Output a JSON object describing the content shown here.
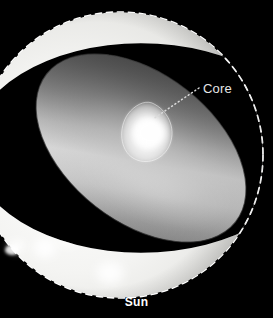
{
  "figure": {
    "title_caption": "Sun",
    "background_color": "#000000"
  },
  "labels": {
    "core": "Core",
    "sun": "Sun"
  },
  "colors": {
    "background": "#000000",
    "photosphere_light": "#f2f2f0",
    "photosphere_mid": "#d8d8d6",
    "interior_gray": "#8a8a8a",
    "interior_dark": "#5a5a5a",
    "core_glow": "#ffffff",
    "outline_dashed": "#ffffff",
    "leader_line": "#d9d9d9",
    "sunspot": "#6b6b6b",
    "label_text": "#e6e6e6",
    "caption_text": "#ffffff"
  },
  "annotations": {
    "core_leader": {
      "style": "dotted",
      "from_x": 199,
      "from_y": 88,
      "to_x": 152,
      "to_y": 118
    },
    "sphere_outline": {
      "style": "dashed",
      "center_x": 120,
      "center_y": 155,
      "radius": 143
    }
  },
  "features": [
    {
      "name": "core",
      "kind": "bright-teardrop",
      "cx": 152,
      "cy": 132
    },
    {
      "name": "granule-upper-left",
      "kind": "bright-patch",
      "cx": 27,
      "cy": 125
    },
    {
      "name": "granule-mid",
      "kind": "bright-patch",
      "cx": 79,
      "cy": 193
    },
    {
      "name": "granule-lower",
      "kind": "bright-patch",
      "cx": 110,
      "cy": 273
    },
    {
      "name": "granule-lower-left",
      "kind": "bright-patch",
      "cx": 45,
      "cy": 250
    },
    {
      "name": "sunspot-cluster-upper",
      "kind": "dark-spot",
      "cx": 27,
      "cy": 162
    },
    {
      "name": "sunspot-cluster-lower",
      "kind": "dark-spot",
      "cx": 30,
      "cy": 188
    },
    {
      "name": "sunspot-center",
      "kind": "dark-spot",
      "cx": 117,
      "cy": 236
    },
    {
      "name": "solar-flare",
      "kind": "bright-flare",
      "cx": 16,
      "cy": 245
    }
  ]
}
